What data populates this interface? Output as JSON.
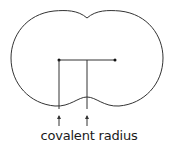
{
  "diagram": {
    "title": "covalent radius",
    "label": "covalent radius",
    "colors": {
      "stroke": "#333333",
      "background": "#ffffff"
    },
    "atoms": [
      {
        "name": "left-nucleus",
        "x": 59,
        "y": 60
      },
      {
        "name": "right-nucleus",
        "x": 115,
        "y": 60
      }
    ],
    "arrows": [
      {
        "name": "arrow-left",
        "x": 59
      },
      {
        "name": "arrow-midpoint",
        "x": 87
      }
    ]
  }
}
